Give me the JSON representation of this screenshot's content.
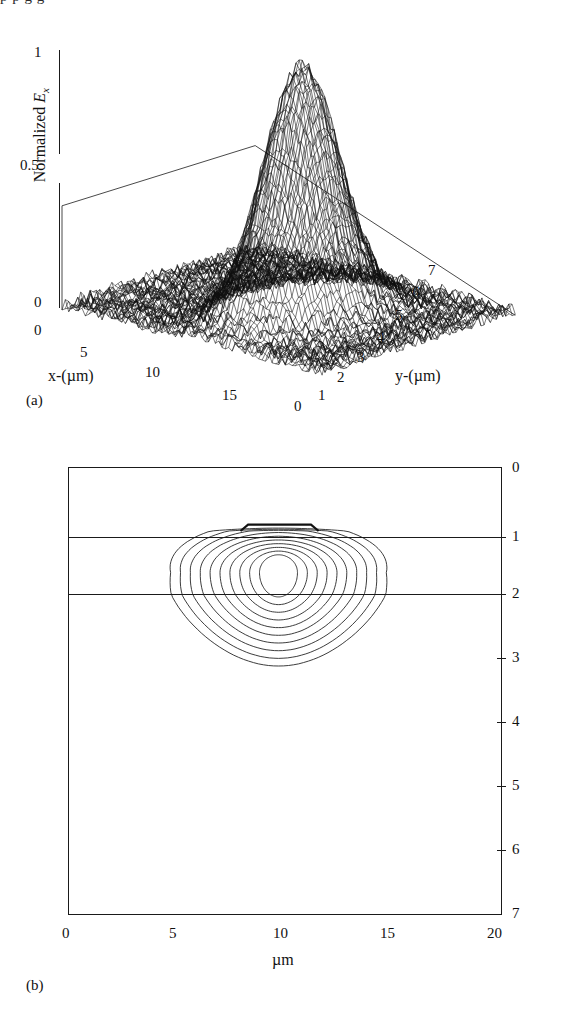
{
  "figure": {
    "top_clipped_text": "p  p g g",
    "panels": [
      {
        "tag": "(a)",
        "name": "3d-surface-mode-profile"
      },
      {
        "tag": "(b)",
        "name": "2d-contour-mode-profile"
      }
    ]
  },
  "panel_a": {
    "tag": "(a)",
    "z_axis_label_prefix": "Normalized ",
    "z_axis_label_symbol": "E",
    "z_axis_label_subscript": "x",
    "z_ticks": [
      "0",
      "0.5",
      "1"
    ],
    "x_axis_label": "x-(µm)",
    "x_ticks": [
      "0",
      "5",
      "10",
      "15"
    ],
    "y_axis_label": "y-(µm)",
    "y_ticks": [
      "0",
      "1",
      "2",
      "3",
      "4",
      "5",
      "6",
      "7"
    ]
  },
  "panel_b": {
    "tag": "(b)",
    "x_axis_label": "µm",
    "x_ticks": [
      "0",
      "5",
      "10",
      "15",
      "20"
    ],
    "y_ticks": [
      "0",
      "1",
      "2",
      "3",
      "4",
      "5",
      "6",
      "7"
    ],
    "layer_boundaries": [
      "1",
      "2"
    ]
  },
  "chart_data": [
    {
      "type": "surface",
      "name": "normalized-Ex-3d-surface",
      "title": "",
      "xlabel": "x-(µm)",
      "ylabel": "y-(µm)",
      "zlabel": "Normalized Ex",
      "xlim": [
        0,
        17
      ],
      "ylim": [
        0,
        7
      ],
      "zlim": [
        0,
        1
      ],
      "xticks": [
        0,
        5,
        10,
        15
      ],
      "yticks": [
        0,
        1,
        2,
        3,
        4,
        5,
        6,
        7
      ],
      "zticks": [
        0,
        0.5,
        1
      ],
      "grid": false,
      "legend": "none",
      "description": "Single sharp Gaussian-like peak of normalized Ex field rising to 1.0 above a near-zero noisy base plane; mesh wireframe rendered dense black.",
      "peak": {
        "x": 9.7,
        "y": 3.3,
        "z": 1.0
      },
      "peak_half_width_x": 2.2,
      "peak_half_width_y": 1.6,
      "baseline": 0.02
    },
    {
      "type": "contour",
      "name": "normalized-Ex-cross-section-contours",
      "title": "",
      "xlabel": "µm",
      "ylabel": "µm",
      "xlim": [
        0,
        20
      ],
      "ylim": [
        7,
        0
      ],
      "xticks": [
        0,
        5,
        10,
        15,
        20
      ],
      "yticks": [
        0,
        1,
        2,
        3,
        4,
        5,
        6,
        7
      ],
      "y_axis_side": "right",
      "y_axis_direction": "inverted",
      "grid": false,
      "legend": "none",
      "n_contour_levels": 10,
      "contour_levels": [
        0.1,
        0.2,
        0.3,
        0.4,
        0.5,
        0.6,
        0.7,
        0.8,
        0.9,
        0.95
      ],
      "center": {
        "x": 9.7,
        "y": 1.65
      },
      "layer_interfaces_um": [
        1.0,
        2.0
      ],
      "rib": {
        "x_start": 8.3,
        "x_end": 11.2,
        "top_um": 0.9,
        "base_um": 1.0
      },
      "extent": {
        "x_min": 4.6,
        "x_max": 14.4,
        "y_min": 0.9,
        "y_max": 3.0
      },
      "description": "Rib waveguide cross-section: guiding layer between 1 and 2 microns with a shallow rib on top; ten nested contour rings of the optical mode centered near x=9.7um, y=1.65um, spreading into the substrate down to about 3um."
    }
  ]
}
